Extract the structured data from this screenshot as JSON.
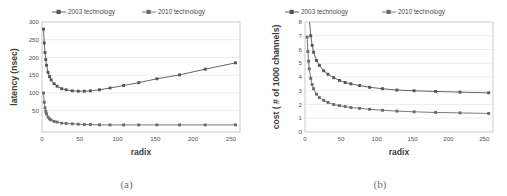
{
  "figure": {
    "panels": [
      {
        "caption": "(a)",
        "legend": [
          "2003 technology",
          "2010 technology"
        ]
      },
      {
        "caption": "(b)",
        "legend": [
          "2003 technology",
          "2010 technology"
        ]
      }
    ],
    "colors": {
      "series_2003": "#555555",
      "series_2010": "#6b6b6b",
      "grid": "#d9d9d9",
      "axis": "#9a9a9a",
      "text": "#555555"
    }
  },
  "chart_data": [
    {
      "type": "line",
      "title": "",
      "caption": "(a)",
      "xlabel": "radix",
      "ylabel": "latency (nsec)",
      "xlim": [
        0,
        262
      ],
      "ylim": [
        0,
        310
      ],
      "xticks": [
        0,
        50,
        100,
        150,
        200,
        250
      ],
      "yticks": [
        50,
        100,
        150,
        200,
        250,
        300
      ],
      "grid": true,
      "legend_position": "top",
      "x": [
        2,
        3,
        4,
        5,
        6,
        8,
        10,
        12,
        16,
        20,
        26,
        32,
        40,
        48,
        56,
        64,
        76,
        90,
        108,
        128,
        152,
        182,
        216,
        256
      ],
      "series": [
        {
          "name": "2003 technology",
          "values": [
            290,
            251,
            224,
            204,
            188,
            168,
            156,
            147,
            136,
            129,
            122,
            119,
            116,
            115,
            115,
            116,
            119,
            124,
            131,
            139,
            150,
            161,
            177,
            195
          ]
        },
        {
          "name": "2010 technology",
          "values": [
            110,
            84,
            68,
            58,
            51,
            42,
            37,
            34,
            30,
            28,
            25,
            24,
            23,
            22,
            21,
            21,
            20,
            20,
            20,
            20,
            20,
            20,
            20,
            20
          ]
        }
      ]
    },
    {
      "type": "line",
      "title": "",
      "caption": "(b)",
      "xlabel": "radix",
      "ylabel": "cost ( # of 1000 channels)",
      "xlim": [
        0,
        262
      ],
      "ylim": [
        0,
        8
      ],
      "xticks": [
        0,
        50,
        100,
        150,
        200,
        250
      ],
      "yticks": [
        0,
        1,
        2,
        3,
        4,
        5,
        6,
        7,
        8
      ],
      "grid": true,
      "legend_position": "top",
      "x": [
        3,
        4,
        5,
        6,
        8,
        10,
        12,
        16,
        20,
        26,
        32,
        40,
        48,
        56,
        64,
        76,
        90,
        108,
        128,
        152,
        182,
        216,
        256
      ],
      "series": [
        {
          "name": "2003 technology",
          "values": [
            14.5,
            11.2,
            9.4,
            8.3,
            7.0,
            6.3,
            5.8,
            5.2,
            4.85,
            4.45,
            4.2,
            3.95,
            3.75,
            3.6,
            3.5,
            3.38,
            3.25,
            3.15,
            3.05,
            3.0,
            2.95,
            2.9,
            2.85
          ]
        },
        {
          "name": "2010 technology",
          "values": [
            6.9,
            5.85,
            5.15,
            4.6,
            3.9,
            3.45,
            3.15,
            2.75,
            2.5,
            2.3,
            2.15,
            2.0,
            1.92,
            1.85,
            1.78,
            1.72,
            1.65,
            1.58,
            1.52,
            1.47,
            1.42,
            1.39,
            1.35
          ]
        }
      ]
    }
  ]
}
